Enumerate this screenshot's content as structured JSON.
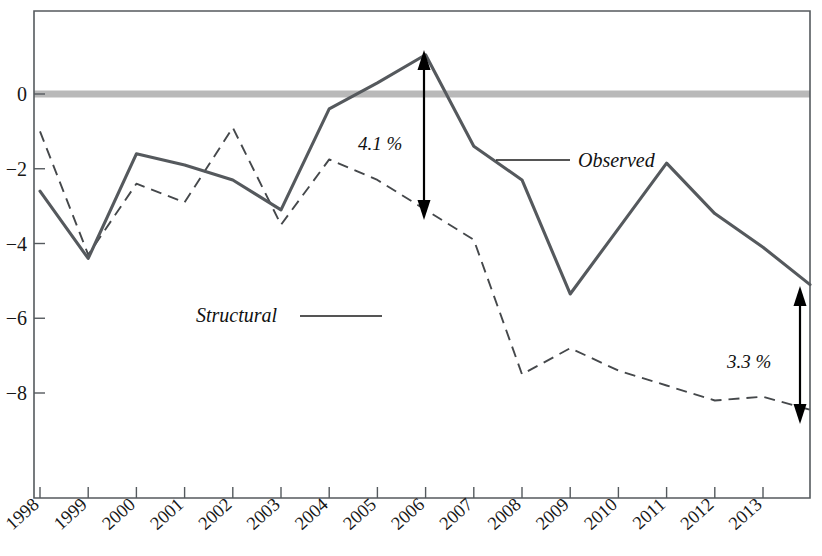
{
  "chart_data": {
    "type": "line",
    "title": "",
    "subtitle": "",
    "xlabel": "",
    "ylabel": "",
    "categories": [
      "1998",
      "1999",
      "2000",
      "2001",
      "2002",
      "2003",
      "2004",
      "2005",
      "2006",
      "2007",
      "2008",
      "2009",
      "2010",
      "2011",
      "2012",
      "2013"
    ],
    "x": [
      1998,
      1999,
      2000,
      2001,
      2002,
      2003,
      2004,
      2005,
      2006,
      2007,
      2008,
      2009,
      2010,
      2011,
      2012,
      2013
    ],
    "ylim": [
      -9.3,
      2.2
    ],
    "xlim": [
      1997.85,
      2014.1
    ],
    "yticks": [
      0,
      -2,
      -4,
      -6,
      -8
    ],
    "ytick_labels": [
      "0",
      "−2",
      "−4",
      "−6",
      "−8"
    ],
    "grid": false,
    "legend_position": "inline-annotations",
    "zero_reference_line": 0,
    "series": [
      {
        "name": "Observed",
        "style": "solid",
        "color": "#55595d",
        "values": [
          -2.6,
          -4.4,
          -1.6,
          -1.9,
          -2.3,
          -3.1,
          -0.4,
          0.3,
          1.05,
          -1.4,
          -2.3,
          -5.35,
          -3.6,
          -1.85,
          -3.2,
          -4.1
        ]
      },
      {
        "name": "Structural",
        "style": "dashed",
        "color": "#45484b",
        "values": [
          -1.0,
          -4.3,
          -2.4,
          -2.9,
          -0.9,
          -3.5,
          -1.75,
          -2.3,
          -3.1,
          -3.9,
          -7.5,
          -6.8,
          -7.4,
          -7.8,
          -8.2,
          -8.1
        ]
      }
    ],
    "annotations": [
      {
        "name": "gap-2006",
        "text": "4.1 %",
        "year": 2006,
        "from": 1.05,
        "to": -3.1
      },
      {
        "name": "gap-2013",
        "text": "3.3 %",
        "year": 2013.6,
        "from": -5.1,
        "to": -8.4
      }
    ],
    "series_labels": [
      {
        "name": "Observed",
        "text": "Observed"
      },
      {
        "name": "Structural",
        "text": "Structural"
      }
    ]
  },
  "axis": {
    "y_labels": [
      "0",
      "−2",
      "−4",
      "−6",
      "−8"
    ],
    "x_labels": [
      "1998",
      "1999",
      "2000",
      "2001",
      "2002",
      "2003",
      "2004",
      "2005",
      "2006",
      "2007",
      "2008",
      "2009",
      "2010",
      "2011",
      "2012",
      "2013"
    ]
  },
  "labels": {
    "observed": "Observed",
    "structural": "Structural",
    "gap_top": "4.1 %",
    "gap_bottom": "3.3 %"
  },
  "colors": {
    "observed_line": "#55595d",
    "structural_line": "#45484b",
    "zero_band": "#b9b9b9",
    "frame": "#555a5e",
    "text": "#171717",
    "background": "#ffffff"
  }
}
